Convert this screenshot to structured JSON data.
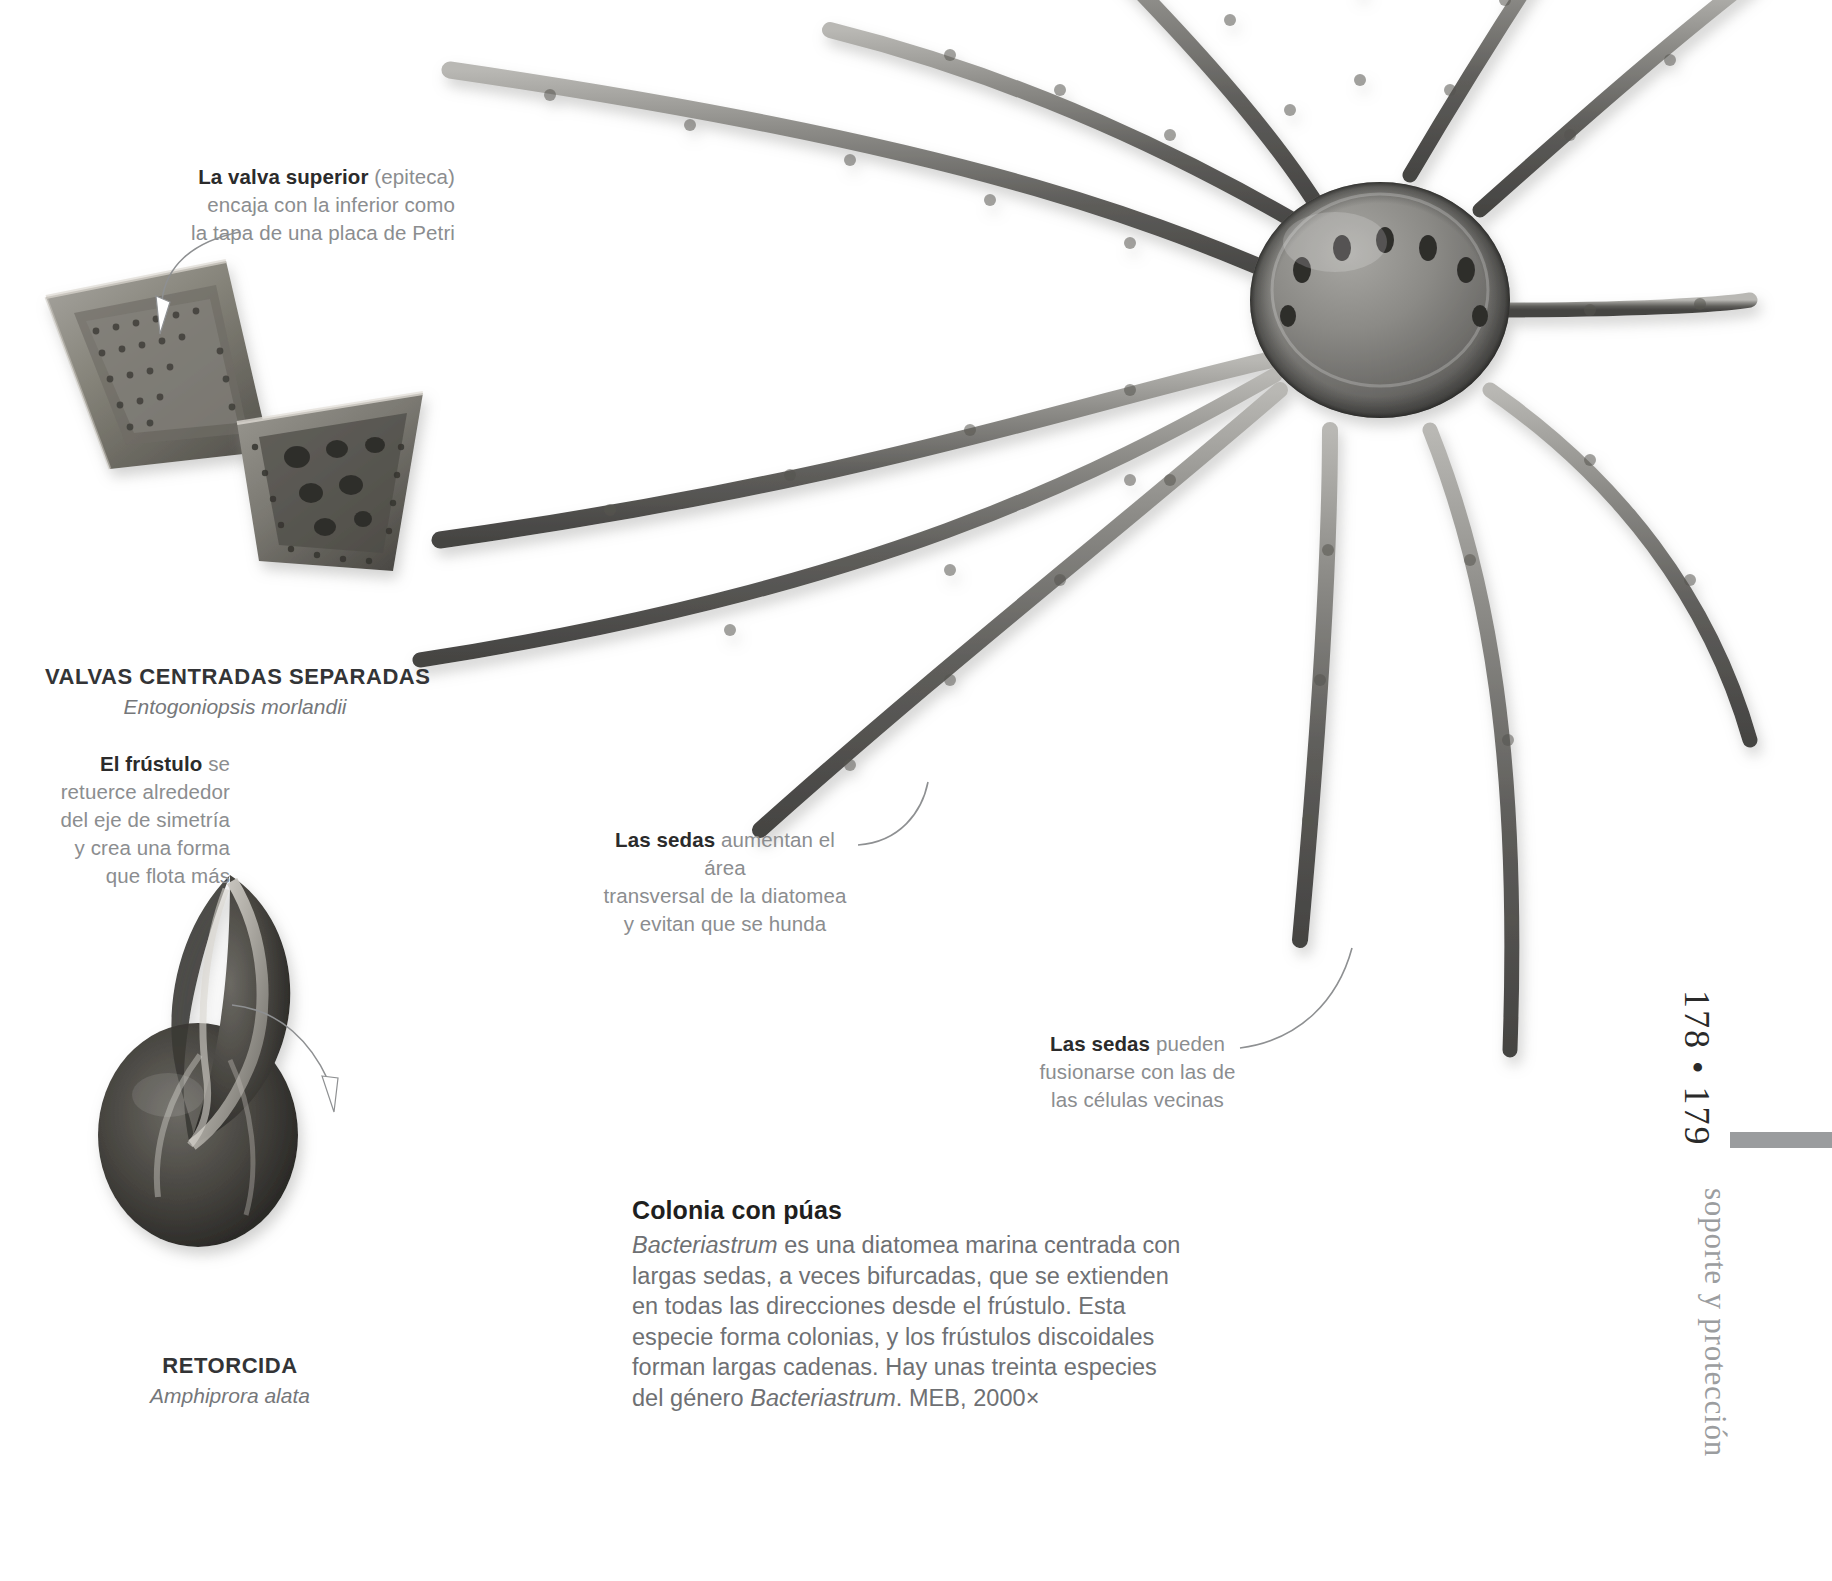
{
  "page": {
    "folio": "178 • 179",
    "section_title": "soporte y protección",
    "background_color": "#ffffff",
    "rule_color": "#9a9c9e"
  },
  "callouts": [
    {
      "id": "valva-superior",
      "lead": "La valva superior",
      "rest": " (epiteca)",
      "lines": [
        "encaja con la inferior como",
        "la tapa de una placa de Petri"
      ]
    },
    {
      "id": "frustulo",
      "lead": "El frústulo",
      "rest": " se",
      "lines": [
        "retuerce alrededor",
        "del eje de simetría",
        "y crea una forma",
        "que flota más"
      ]
    },
    {
      "id": "sedas-area",
      "lead": "Las sedas",
      "rest": " aumentan el área",
      "lines": [
        "transversal de la diatomea",
        "y evitan que se hunda"
      ]
    },
    {
      "id": "sedas-fusion",
      "lead": "Las sedas",
      "rest": " pueden",
      "lines": [
        "fusionarse con las de",
        "las células vecinas"
      ]
    }
  ],
  "specimens": [
    {
      "id": "valvas",
      "name": "VALVAS CENTRADAS SEPARADAS",
      "latin": "Entogoniopsis morlandii"
    },
    {
      "id": "retorcida",
      "name": "RETORCIDA",
      "latin": "Amphiprora alata"
    }
  ],
  "body": {
    "heading": "Colonia con púas",
    "paragraph_parts": [
      {
        "text": "Bacteriastrum",
        "italic": true
      },
      {
        "text": " es una diatomea marina centrada con largas sedas, a veces bifurcadas, que se extienden en todas las direcciones desde el frústulo. Esta especie forma colonias, y los frústulos discoidales forman largas cadenas. Hay unas treinta especies del género ",
        "italic": false
      },
      {
        "text": "Bacteriastrum",
        "italic": true
      },
      {
        "text": ". MEB, 2000×",
        "italic": false
      }
    ]
  },
  "figures": [
    {
      "id": "valve-upper",
      "kind": "sem-micrograph",
      "subject": "triangular diatom valve, upper"
    },
    {
      "id": "valve-lower",
      "kind": "sem-micrograph",
      "subject": "triangular diatom valve, lower"
    },
    {
      "id": "amphiprora",
      "kind": "sem-micrograph",
      "subject": "twisted frustule Amphiprora alata"
    },
    {
      "id": "bacteriastrum",
      "kind": "sem-micrograph",
      "subject": "Bacteriastrum colony with radiating setae"
    }
  ]
}
